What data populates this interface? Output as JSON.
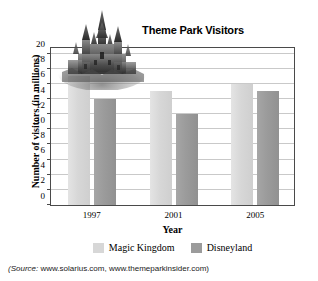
{
  "chart_data": {
    "type": "bar",
    "title": "Theme Park Visitors",
    "xlabel": "Year",
    "ylabel": "Number of visitors (in millions)",
    "categories": [
      "1997",
      "2001",
      "2005"
    ],
    "series": [
      {
        "name": "Magic Kingdom",
        "values": [
          17,
          15,
          16
        ],
        "color": "#d7d7d7"
      },
      {
        "name": "Disneyland",
        "values": [
          14,
          12,
          15
        ],
        "color": "#9b9b9b"
      }
    ],
    "ylim": [
      0,
      21
    ],
    "ytick_values": [
      0,
      2,
      4,
      6,
      8,
      10,
      12,
      14,
      16,
      18,
      20
    ],
    "ytick_labels": [
      "0",
      "2",
      "4",
      "6",
      "8",
      "10",
      "12",
      "14",
      "16",
      "18",
      "20"
    ],
    "grid": true,
    "legend_position": "bottom"
  },
  "annotations": {
    "source_prefix": "(Source:",
    "source_text": " www.solarius.com, www.themeparkinsider.com)",
    "decoration": "cinderella-castle-photo"
  }
}
